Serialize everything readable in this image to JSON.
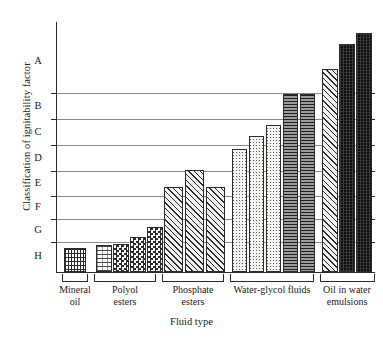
{
  "chart_data": {
    "type": "bar",
    "title": "",
    "xlabel": "Fluid type",
    "ylabel": "Classification of ignitability factor",
    "grid": true,
    "legend": "none",
    "y_tick_labels": [
      "A",
      "B",
      "C",
      "D",
      "E",
      "F",
      "G",
      "H"
    ],
    "y_axis_order": "A at top (most ignitable class) to H at bottom",
    "ylim": [
      "H",
      "above A"
    ],
    "categories": [
      "Mineral oil",
      "Polyol esters",
      "Phosphate esters",
      "Water-glycol fluids",
      "Oil in water emulsions"
    ],
    "groups": [
      {
        "name": "Mineral oil",
        "label_lines": [
          "Mineral",
          "oil"
        ],
        "bars": [
          {
            "fill": "vertical-grid",
            "value": "H",
            "height_px": 24
          }
        ]
      },
      {
        "name": "Polyol esters",
        "label_lines": [
          "Polyol",
          "esters"
        ],
        "bars": [
          {
            "fill": "sparse-mixed",
            "value": "H",
            "height_px": 27
          },
          {
            "fill": "checkerboard",
            "value": "H",
            "height_px": 28
          },
          {
            "fill": "checkerboard",
            "value": "H",
            "height_px": 35
          },
          {
            "fill": "checkerboard",
            "value": "G",
            "height_px": 45
          }
        ]
      },
      {
        "name": "Phosphate esters",
        "label_lines": [
          "Phosphate",
          "esters"
        ],
        "bars": [
          {
            "fill": "diagonal-hatch",
            "value": "E",
            "height_px": 85
          },
          {
            "fill": "diagonal-hatch",
            "value": "D",
            "height_px": 102
          },
          {
            "fill": "diagonal-hatch",
            "value": "E",
            "height_px": 85
          }
        ]
      },
      {
        "name": "Water-glycol fluids",
        "label_lines": [
          "Water-glycol fluids"
        ],
        "bars": [
          {
            "fill": "stipple",
            "value": "D",
            "height_px": 123
          },
          {
            "fill": "stipple",
            "value": "C",
            "height_px": 136
          },
          {
            "fill": "stipple",
            "value": "C",
            "height_px": 147
          },
          {
            "fill": "horizontal-lines",
            "value": "B",
            "height_px": 178
          },
          {
            "fill": "horizontal-lines",
            "value": "B",
            "height_px": 178
          }
        ]
      },
      {
        "name": "Oil in water emulsions",
        "label_lines": [
          "Oil in water",
          "emulsions"
        ],
        "bars": [
          {
            "fill": "diagonal-hatch",
            "value": "B",
            "height_px": 203
          },
          {
            "fill": "dark-solid",
            "value": "A",
            "height_px": 228
          },
          {
            "fill": "dark-solid",
            "value": "A",
            "height_px": 239
          }
        ]
      }
    ]
  },
  "axes": {
    "y_title": "Classification of ignitability factor",
    "x_title": "Fluid type",
    "y_labels": [
      {
        "text": "A"
      },
      {
        "text": "B"
      },
      {
        "text": "C"
      },
      {
        "text": "D"
      },
      {
        "text": "E"
      },
      {
        "text": "F"
      },
      {
        "text": "G"
      },
      {
        "text": "H"
      }
    ]
  },
  "group_labels": [
    {
      "line1": "Mineral",
      "line2": "oil"
    },
    {
      "line1": "Polyol",
      "line2": "esters"
    },
    {
      "line1": "Phosphate",
      "line2": "esters"
    },
    {
      "line1": "Water-glycol fluids",
      "line2": ""
    },
    {
      "line1": "Oil in water",
      "line2": "emulsions"
    }
  ],
  "colors": {
    "axis": "#2b2b2b",
    "grid": "#8a8a8a",
    "bar_outline": "#2b2b2b",
    "dark_bar": "#0d0d0d",
    "grey_bar": "#8d8d8d",
    "background": "#ffffff"
  }
}
